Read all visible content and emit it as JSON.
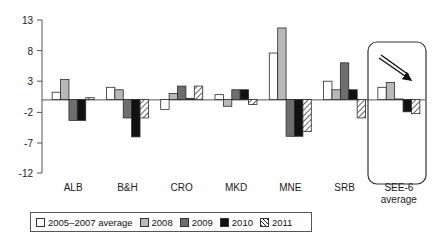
{
  "chart_data": {
    "type": "bar",
    "title": "",
    "xlabel": "",
    "ylabel": "",
    "ylim": [
      -12,
      13
    ],
    "yticks": [
      13,
      8,
      3,
      -2,
      -7,
      -12
    ],
    "grid": false,
    "legend_position": "bottom",
    "categories": [
      "ALB",
      "B&H",
      "CRO",
      "MKD",
      "MNE",
      "SRB",
      "SEE-6 average"
    ],
    "series": [
      {
        "name": "2005–2007 average",
        "fill": "white",
        "values": [
          1.2,
          2.0,
          -1.6,
          0.8,
          7.6,
          3.0,
          2.0
        ]
      },
      {
        "name": "2008",
        "fill": "light-gray",
        "values": [
          3.3,
          1.6,
          1.0,
          -1.1,
          11.7,
          1.6,
          2.8
        ]
      },
      {
        "name": "2009",
        "fill": "dark-gray",
        "values": [
          -3.4,
          -3.0,
          2.2,
          1.6,
          -6.0,
          6.0,
          0.1
        ]
      },
      {
        "name": "2010",
        "fill": "black",
        "values": [
          -3.4,
          -6.1,
          0.2,
          1.6,
          -6.0,
          1.6,
          -2.0
        ]
      },
      {
        "name": "2011",
        "fill": "hatched",
        "values": [
          0.3,
          -3.0,
          2.2,
          -0.8,
          -5.2,
          -3.0,
          -2.3
        ]
      }
    ],
    "annotation": {
      "highlight_group": "SEE-6 average",
      "shape": "rounded-rectangle",
      "arrow": "down-right-arrow"
    }
  },
  "legend": {
    "items": [
      {
        "label": "2005–2007 average",
        "swatch": "sw-white"
      },
      {
        "label": "2008",
        "swatch": "sw-lgray"
      },
      {
        "label": "2009",
        "swatch": "sw-dgray"
      },
      {
        "label": "2010",
        "swatch": "sw-black"
      },
      {
        "label": "2011",
        "swatch": "sw-hatch"
      }
    ]
  },
  "colors": {
    "white": "#ffffff",
    "light_gray": "#b8b8b8",
    "dark_gray": "#6e6e6e",
    "black": "#111111",
    "axis": "#555555"
  }
}
